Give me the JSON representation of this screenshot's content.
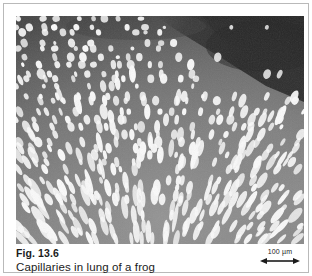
{
  "figure": {
    "number_label": "Fig. 13.6",
    "caption": "Capillaries in lung of a frog",
    "scale_bar": {
      "label": "100 µm",
      "icon": "double-headed-arrow-icon"
    }
  },
  "micrograph": {
    "alt_description": "Scanning electron micrograph of a frog lung showing a dense radial fan of white capillary vessel profiles on a gray tissue background with a dark band across the upper right",
    "colors": {
      "background_light": "#8a8a8a",
      "background_mid": "#6b6b6b",
      "background_dark": "#3a3a3a",
      "band_dark": "#1c1c1c",
      "capillary_white": "#fafafa",
      "frame_border": "#b9b9b9",
      "text": "#1b1b1b",
      "page_background": "#ffffff"
    }
  }
}
